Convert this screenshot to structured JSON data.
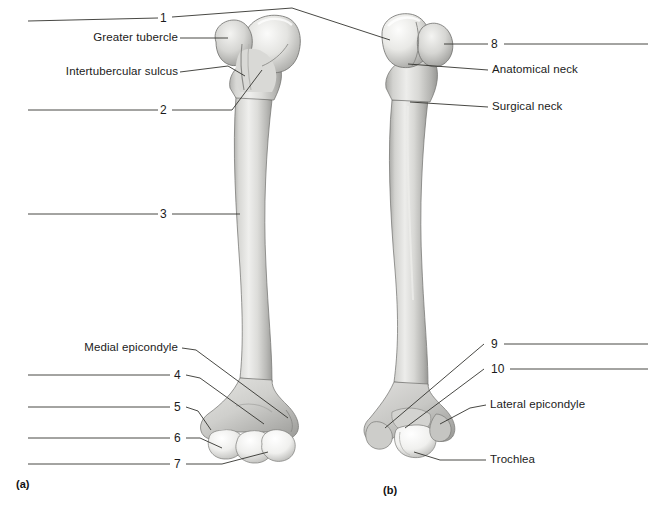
{
  "figure": {
    "background_color": "#ffffff",
    "line_color": "#33332f",
    "text_color": "#1b1b1b",
    "bone_fill_light": "#f2f2f0",
    "bone_fill_mid": "#c9c9c6",
    "bone_fill_dark": "#9a9a97"
  },
  "panels": [
    {
      "id": "a",
      "label": "(a)",
      "view": "anterior"
    },
    {
      "id": "b",
      "label": "(b)",
      "view": "posterior"
    }
  ],
  "labels": {
    "a": [
      {
        "key": "blank-1",
        "text": "1",
        "kind": "number"
      },
      {
        "key": "greater-tubercle",
        "text": "Greater tubercle",
        "kind": "name"
      },
      {
        "key": "intertubercular-sulcus",
        "text": "Intertubercular sulcus",
        "kind": "name"
      },
      {
        "key": "blank-2",
        "text": "2",
        "kind": "number"
      },
      {
        "key": "blank-3",
        "text": "3",
        "kind": "number"
      },
      {
        "key": "medial-epicondyle",
        "text": "Medial epicondyle",
        "kind": "name"
      },
      {
        "key": "blank-4",
        "text": "4",
        "kind": "number"
      },
      {
        "key": "blank-5",
        "text": "5",
        "kind": "number"
      },
      {
        "key": "blank-6",
        "text": "6",
        "kind": "number"
      },
      {
        "key": "blank-7",
        "text": "7",
        "kind": "number"
      }
    ],
    "b": [
      {
        "key": "blank-8",
        "text": "8",
        "kind": "number"
      },
      {
        "key": "anatomical-neck",
        "text": "Anatomical neck",
        "kind": "name"
      },
      {
        "key": "surgical-neck",
        "text": "Surgical neck",
        "kind": "name"
      },
      {
        "key": "blank-9",
        "text": "9",
        "kind": "number"
      },
      {
        "key": "blank-10",
        "text": "10",
        "kind": "number"
      },
      {
        "key": "lateral-epicondyle",
        "text": "Lateral epicondyle",
        "kind": "name"
      },
      {
        "key": "trochlea",
        "text": "Trochlea",
        "kind": "name"
      }
    ]
  }
}
